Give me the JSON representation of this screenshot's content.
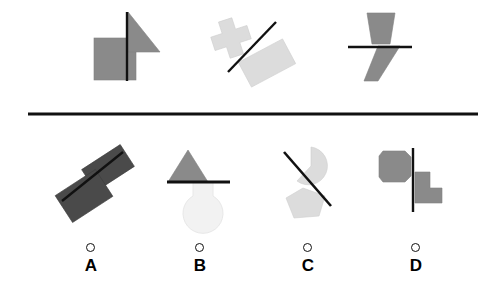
{
  "figure": {
    "type": "visual-analogy-puzzle",
    "background_color": "#ffffff",
    "width": 498,
    "height": 300,
    "divider": {
      "name": "horizontal-divider",
      "x1": 28,
      "y1": 114,
      "x2": 478,
      "y2": 114,
      "color": "#111111",
      "stroke_width": 3
    },
    "colors": {
      "medium_gray": "#8a8a8a",
      "light_gray": "#dcdcdc",
      "very_light_gray": "#f2f2f2",
      "dark_gray": "#4a4a4a",
      "line_black": "#111111",
      "stroke_outline": "#7a7a7a"
    },
    "prompt_panels": [
      {
        "id": "prompt-1",
        "index": 1,
        "shapes": [
          "square",
          "right-triangle",
          "vertical-line"
        ],
        "fill": "#8a8a8a"
      },
      {
        "id": "prompt-2",
        "index": 2,
        "shapes": [
          "cross",
          "rotated-rectangle",
          "diagonal-line"
        ],
        "fill": "#dcdcdc"
      },
      {
        "id": "prompt-3",
        "index": 3,
        "shapes": [
          "trapezoid",
          "parallelogram",
          "horizontal-line"
        ],
        "fill": "#8a8a8a"
      }
    ],
    "options": [
      {
        "id": "option-a",
        "label": "A",
        "selected": false,
        "shapes": [
          "rotated-rectangle",
          "rotated-rectangle",
          "diagonal-line"
        ],
        "fill": "#4a4a4a",
        "radio_x": 86,
        "radio_y": 243,
        "label_x": 71,
        "label_y": 256
      },
      {
        "id": "option-b",
        "label": "B",
        "selected": false,
        "shapes": [
          "triangle",
          "rounded-blob",
          "horizontal-line"
        ],
        "fill": "#8a8a8a",
        "radio_x": 195,
        "radio_y": 243,
        "label_x": 180,
        "label_y": 256
      },
      {
        "id": "option-c",
        "label": "C",
        "selected": false,
        "shapes": [
          "pie-wedge",
          "pentagon",
          "diagonal-line"
        ],
        "fill": "#dcdcdc",
        "radio_x": 303,
        "radio_y": 243,
        "label_x": 288,
        "label_y": 256
      },
      {
        "id": "option-d",
        "label": "D",
        "selected": false,
        "shapes": [
          "octagon",
          "l-shape",
          "vertical-line"
        ],
        "fill": "#8a8a8a",
        "radio_x": 411,
        "radio_y": 243,
        "label_x": 396,
        "label_y": 256
      }
    ]
  }
}
